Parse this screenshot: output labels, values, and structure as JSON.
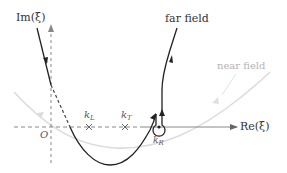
{
  "diagram": {
    "title": "",
    "axes": {
      "imaginary_label": "Im(ξ)",
      "real_label": "Re(ξ)",
      "origin_label": "O"
    },
    "curves": {
      "far_field_label": "far field",
      "near_field_label": "near field"
    },
    "points": {
      "kL": {
        "main": "k",
        "sub": "L"
      },
      "kT": {
        "main": "k",
        "sub": "T"
      },
      "kR": {
        "main": "k",
        "sub": "R"
      }
    },
    "colors": {
      "contour": "#222222",
      "near_field": "#d8d8d8",
      "axis_dashed": "#888888",
      "real_axis_solid": "#888888",
      "text_dark": "#333333",
      "text_light": "#b4b4b4"
    }
  }
}
